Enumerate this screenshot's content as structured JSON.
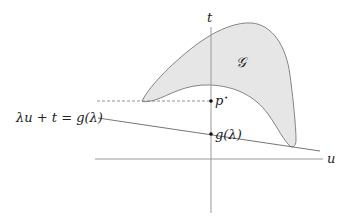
{
  "diagram": {
    "axes": {
      "horizontal_label": "u",
      "vertical_label": "t"
    },
    "region": {
      "label": "𝒢",
      "fill_color": "#e6e6e6",
      "stroke_color": "#777777"
    },
    "points": {
      "p_star_label": "p",
      "p_star_superscript": "⋆",
      "g_lambda_label": "g(λ)"
    },
    "supporting_line": {
      "equation_label": "λu + t = g(λ)"
    },
    "colors": {
      "axis": "#9a9a9a",
      "line": "#666666",
      "text": "#222222"
    }
  }
}
